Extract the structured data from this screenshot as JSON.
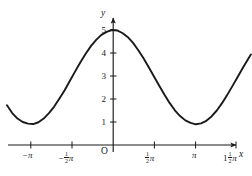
{
  "chart_data": {
    "type": "line",
    "title": "",
    "xlabel": "x",
    "ylabel": "y",
    "grid": false,
    "legend": null,
    "xlim": [
      -4.3,
      5.4
    ],
    "ylim": [
      0,
      5.6
    ],
    "x_tick_labels": [
      "-π",
      "-½π",
      "O",
      "½π",
      "π",
      "1½π"
    ],
    "x_tick_values": [
      -3.14159,
      -1.5708,
      0,
      1.5708,
      3.14159,
      4.71239
    ],
    "y_tick_labels": [
      "1",
      "2",
      "3",
      "4",
      "5"
    ],
    "y_tick_values": [
      1,
      2,
      3,
      4,
      5
    ],
    "function": "y = 2.05*cos(x) + 2.95",
    "amplitude": 2.05,
    "midline": 2.95,
    "period": 6.28319,
    "maximum": 5,
    "minimum": 0.9,
    "x_domain_drawn": [
      -4.05,
      5.25
    ],
    "series": [
      {
        "name": "cosine curve",
        "color": "#1a1a1a",
        "x": [
          -4.05,
          -3.85,
          -3.65,
          -3.45,
          -3.25,
          -3.05,
          -2.85,
          -2.65,
          -2.45,
          -2.25,
          -2.05,
          -1.85,
          -1.65,
          -1.45,
          -1.25,
          -1.05,
          -0.85,
          -0.65,
          -0.45,
          -0.25,
          -0.05,
          0.15,
          0.35,
          0.55,
          0.75,
          0.95,
          1.15,
          1.35,
          1.55,
          1.75,
          1.95,
          2.15,
          2.35,
          2.55,
          2.75,
          2.95,
          3.15,
          3.35,
          3.55,
          3.75,
          3.95,
          4.15,
          4.35,
          4.55,
          4.75,
          4.95,
          5.15,
          5.25
        ],
        "y": [
          1.73,
          1.39,
          1.15,
          1.0,
          0.93,
          0.91,
          0.99,
          1.15,
          1.39,
          1.67,
          2.02,
          2.38,
          2.79,
          3.2,
          3.6,
          3.97,
          4.3,
          4.57,
          4.79,
          4.92,
          5.0,
          4.98,
          4.87,
          4.7,
          4.45,
          4.13,
          3.78,
          3.39,
          2.99,
          2.59,
          2.2,
          1.83,
          1.51,
          1.26,
          1.07,
          0.96,
          0.9,
          0.94,
          1.05,
          1.24,
          1.5,
          1.82,
          2.18,
          2.57,
          2.97,
          3.37,
          3.75,
          3.93
        ]
      }
    ]
  },
  "labels": {
    "y_axis_name": "y",
    "x_axis_name": "x",
    "origin": "O",
    "y_ticks": [
      "5",
      "4",
      "3",
      "2",
      "1"
    ],
    "x_tick_neg_pi": "−",
    "x_tick_pi_symbol": "π",
    "x_tick_one": "1",
    "frac_num": "1",
    "frac_den": "2"
  }
}
